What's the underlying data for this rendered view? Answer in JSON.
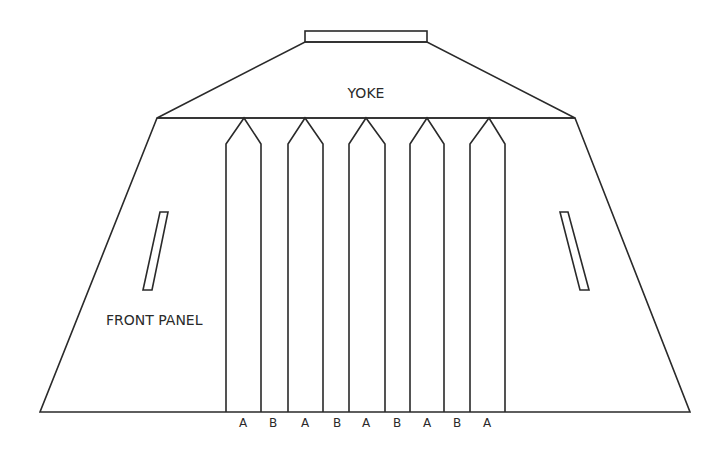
{
  "diagram": {
    "labels": {
      "yoke": "YOKE",
      "front_panel": "FRONT PANEL"
    },
    "pleat_labels": [
      "A",
      "B",
      "A",
      "B",
      "A",
      "B",
      "A",
      "B",
      "A"
    ],
    "colors": {
      "line": "#2a2a2a",
      "background": "#ffffff"
    }
  }
}
